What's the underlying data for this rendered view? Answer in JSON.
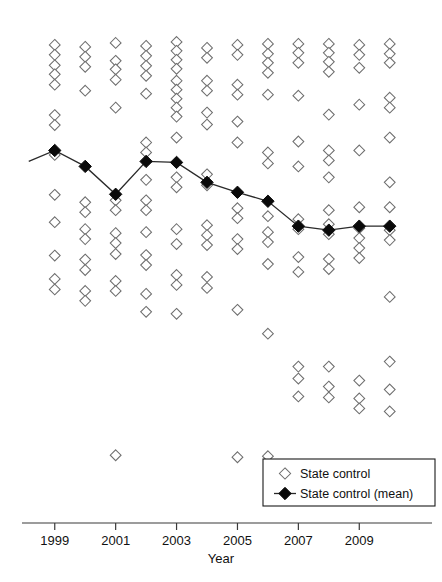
{
  "chart_data": {
    "type": "scatter",
    "title": "",
    "xlabel": "Year",
    "ylabel": "",
    "xlim": [
      1998.45,
      2010.6
    ],
    "ylim": [
      0,
      100
    ],
    "grid": false,
    "legend_position": "bottom-right",
    "x_tick_labels": [
      "1999",
      "2001",
      "2003",
      "2005",
      "2007",
      "2009"
    ],
    "x_tick_values": [
      1999,
      2001,
      2003,
      2005,
      2007,
      2009
    ],
    "x_all_categories": [
      1999,
      2000,
      2001,
      2002,
      2003,
      2004,
      2005,
      2006,
      2007,
      2008,
      2009,
      2010
    ],
    "y_axis_visible": false,
    "series": [
      {
        "name": "State control",
        "marker": "open-diamond",
        "marker_color": "#ffffff",
        "edge_color": "#6e6e6e",
        "points": [
          {
            "x": 1999,
            "y": 94.6
          },
          {
            "x": 1999,
            "y": 92.6
          },
          {
            "x": 1999,
            "y": 90.5
          },
          {
            "x": 1999,
            "y": 88.7
          },
          {
            "x": 1999,
            "y": 86.6
          },
          {
            "x": 1999,
            "y": 80.5
          },
          {
            "x": 1999,
            "y": 78.5
          },
          {
            "x": 1999,
            "y": 72.5
          },
          {
            "x": 1999,
            "y": 64.5
          },
          {
            "x": 1999,
            "y": 59.0
          },
          {
            "x": 1999,
            "y": 52.3
          },
          {
            "x": 1999,
            "y": 47.6
          },
          {
            "x": 1999,
            "y": 45.5
          },
          {
            "x": 2000,
            "y": 94.2
          },
          {
            "x": 2000,
            "y": 92.2
          },
          {
            "x": 2000,
            "y": 90.2
          },
          {
            "x": 2000,
            "y": 85.4
          },
          {
            "x": 2000,
            "y": 63.0
          },
          {
            "x": 2000,
            "y": 61.0
          },
          {
            "x": 2000,
            "y": 57.6
          },
          {
            "x": 2000,
            "y": 55.6
          },
          {
            "x": 2000,
            "y": 51.5
          },
          {
            "x": 2000,
            "y": 49.4
          },
          {
            "x": 2000,
            "y": 45.2
          },
          {
            "x": 2000,
            "y": 43.2
          },
          {
            "x": 2001,
            "y": 95.0
          },
          {
            "x": 2001,
            "y": 91.4
          },
          {
            "x": 2001,
            "y": 89.7
          },
          {
            "x": 2001,
            "y": 87.6
          },
          {
            "x": 2001,
            "y": 82.0
          },
          {
            "x": 2001,
            "y": 63.4
          },
          {
            "x": 2001,
            "y": 61.4
          },
          {
            "x": 2001,
            "y": 56.8
          },
          {
            "x": 2001,
            "y": 54.8
          },
          {
            "x": 2001,
            "y": 52.6
          },
          {
            "x": 2001,
            "y": 47.2
          },
          {
            "x": 2001,
            "y": 45.2
          },
          {
            "x": 2001,
            "y": 12.2
          },
          {
            "x": 2002,
            "y": 94.4
          },
          {
            "x": 2002,
            "y": 92.4
          },
          {
            "x": 2002,
            "y": 90.4
          },
          {
            "x": 2002,
            "y": 88.4
          },
          {
            "x": 2002,
            "y": 84.8
          },
          {
            "x": 2002,
            "y": 75.0
          },
          {
            "x": 2002,
            "y": 73.0
          },
          {
            "x": 2002,
            "y": 67.5
          },
          {
            "x": 2002,
            "y": 63.4
          },
          {
            "x": 2002,
            "y": 61.4
          },
          {
            "x": 2002,
            "y": 57.0
          },
          {
            "x": 2002,
            "y": 52.4
          },
          {
            "x": 2002,
            "y": 50.4
          },
          {
            "x": 2002,
            "y": 44.6
          },
          {
            "x": 2002,
            "y": 41.0
          },
          {
            "x": 2003,
            "y": 95.2
          },
          {
            "x": 2003,
            "y": 93.4
          },
          {
            "x": 2003,
            "y": 91.6
          },
          {
            "x": 2003,
            "y": 89.8
          },
          {
            "x": 2003,
            "y": 87.4
          },
          {
            "x": 2003,
            "y": 85.6
          },
          {
            "x": 2003,
            "y": 83.8
          },
          {
            "x": 2003,
            "y": 82.0
          },
          {
            "x": 2003,
            "y": 80.2
          },
          {
            "x": 2003,
            "y": 76.0
          },
          {
            "x": 2003,
            "y": 68.0
          },
          {
            "x": 2003,
            "y": 66.0
          },
          {
            "x": 2003,
            "y": 57.6
          },
          {
            "x": 2003,
            "y": 54.6
          },
          {
            "x": 2003,
            "y": 48.4
          },
          {
            "x": 2003,
            "y": 46.4
          },
          {
            "x": 2003,
            "y": 40.6
          },
          {
            "x": 2004,
            "y": 94.0
          },
          {
            "x": 2004,
            "y": 92.0
          },
          {
            "x": 2004,
            "y": 87.4
          },
          {
            "x": 2004,
            "y": 85.4
          },
          {
            "x": 2004,
            "y": 81.0
          },
          {
            "x": 2004,
            "y": 78.6
          },
          {
            "x": 2004,
            "y": 68.6
          },
          {
            "x": 2004,
            "y": 66.4
          },
          {
            "x": 2004,
            "y": 58.4
          },
          {
            "x": 2004,
            "y": 56.4
          },
          {
            "x": 2004,
            "y": 54.4
          },
          {
            "x": 2004,
            "y": 48.0
          },
          {
            "x": 2004,
            "y": 45.8
          },
          {
            "x": 2005,
            "y": 94.6
          },
          {
            "x": 2005,
            "y": 92.6
          },
          {
            "x": 2005,
            "y": 86.6
          },
          {
            "x": 2005,
            "y": 84.6
          },
          {
            "x": 2005,
            "y": 79.2
          },
          {
            "x": 2005,
            "y": 75.0
          },
          {
            "x": 2005,
            "y": 61.8
          },
          {
            "x": 2005,
            "y": 59.8
          },
          {
            "x": 2005,
            "y": 55.6
          },
          {
            "x": 2005,
            "y": 53.6
          },
          {
            "x": 2005,
            "y": 41.4
          },
          {
            "x": 2005,
            "y": 11.8
          },
          {
            "x": 2006,
            "y": 94.8
          },
          {
            "x": 2006,
            "y": 92.8
          },
          {
            "x": 2006,
            "y": 91.0
          },
          {
            "x": 2006,
            "y": 89.0
          },
          {
            "x": 2006,
            "y": 84.6
          },
          {
            "x": 2006,
            "y": 73.0
          },
          {
            "x": 2006,
            "y": 70.8
          },
          {
            "x": 2006,
            "y": 60.2
          },
          {
            "x": 2006,
            "y": 57.0
          },
          {
            "x": 2006,
            "y": 55.0
          },
          {
            "x": 2006,
            "y": 50.6
          },
          {
            "x": 2006,
            "y": 36.6
          },
          {
            "x": 2006,
            "y": 12.0
          },
          {
            "x": 2007,
            "y": 94.8
          },
          {
            "x": 2007,
            "y": 93.0
          },
          {
            "x": 2007,
            "y": 91.0
          },
          {
            "x": 2007,
            "y": 84.4
          },
          {
            "x": 2007,
            "y": 75.2
          },
          {
            "x": 2007,
            "y": 70.2
          },
          {
            "x": 2007,
            "y": 59.6
          },
          {
            "x": 2007,
            "y": 57.6
          },
          {
            "x": 2007,
            "y": 52.0
          },
          {
            "x": 2007,
            "y": 49.0
          },
          {
            "x": 2007,
            "y": 30.0
          },
          {
            "x": 2007,
            "y": 27.6
          },
          {
            "x": 2007,
            "y": 24.0
          },
          {
            "x": 2008,
            "y": 94.8
          },
          {
            "x": 2008,
            "y": 93.0
          },
          {
            "x": 2008,
            "y": 91.2
          },
          {
            "x": 2008,
            "y": 89.2
          },
          {
            "x": 2008,
            "y": 80.6
          },
          {
            "x": 2008,
            "y": 73.4
          },
          {
            "x": 2008,
            "y": 71.4
          },
          {
            "x": 2008,
            "y": 68.0
          },
          {
            "x": 2008,
            "y": 61.4
          },
          {
            "x": 2008,
            "y": 58.6
          },
          {
            "x": 2008,
            "y": 56.6
          },
          {
            "x": 2008,
            "y": 51.6
          },
          {
            "x": 2008,
            "y": 49.6
          },
          {
            "x": 2008,
            "y": 30.0
          },
          {
            "x": 2008,
            "y": 26.0
          },
          {
            "x": 2008,
            "y": 23.8
          },
          {
            "x": 2009,
            "y": 94.6
          },
          {
            "x": 2009,
            "y": 92.6
          },
          {
            "x": 2009,
            "y": 90.0
          },
          {
            "x": 2009,
            "y": 82.6
          },
          {
            "x": 2009,
            "y": 73.4
          },
          {
            "x": 2009,
            "y": 62.0
          },
          {
            "x": 2009,
            "y": 57.8
          },
          {
            "x": 2009,
            "y": 55.8
          },
          {
            "x": 2009,
            "y": 53.8
          },
          {
            "x": 2009,
            "y": 51.8
          },
          {
            "x": 2009,
            "y": 27.2
          },
          {
            "x": 2009,
            "y": 23.6
          },
          {
            "x": 2009,
            "y": 21.6
          },
          {
            "x": 2010,
            "y": 94.8
          },
          {
            "x": 2010,
            "y": 92.8
          },
          {
            "x": 2010,
            "y": 91.0
          },
          {
            "x": 2010,
            "y": 84.0
          },
          {
            "x": 2010,
            "y": 82.0
          },
          {
            "x": 2010,
            "y": 76.0
          },
          {
            "x": 2010,
            "y": 67.0
          },
          {
            "x": 2010,
            "y": 62.0
          },
          {
            "x": 2010,
            "y": 57.4
          },
          {
            "x": 2010,
            "y": 55.4
          },
          {
            "x": 2010,
            "y": 44.0
          },
          {
            "x": 2010,
            "y": 31.0
          },
          {
            "x": 2010,
            "y": 25.4
          },
          {
            "x": 2010,
            "y": 21.0
          }
        ]
      },
      {
        "name": "State control (mean)",
        "marker": "filled-diamond",
        "marker_color": "#0a0a0a",
        "line": true,
        "line_color": "#2a2a2a",
        "points": [
          {
            "x": 1999,
            "y": 73.4
          },
          {
            "x": 2000,
            "y": 70.2
          },
          {
            "x": 2001,
            "y": 64.6
          },
          {
            "x": 2002,
            "y": 71.2
          },
          {
            "x": 2003,
            "y": 71.0
          },
          {
            "x": 2004,
            "y": 67.0
          },
          {
            "x": 2005,
            "y": 65.0
          },
          {
            "x": 2006,
            "y": 63.2
          },
          {
            "x": 2007,
            "y": 58.2
          },
          {
            "x": 2008,
            "y": 57.4
          },
          {
            "x": 2009,
            "y": 58.2
          },
          {
            "x": 2010,
            "y": 58.2
          }
        ]
      }
    ]
  },
  "axis": {
    "x_title": "Year"
  },
  "legend": {
    "entries": [
      {
        "label": "State control",
        "marker": "open-diamond"
      },
      {
        "label": "State control (mean)",
        "marker": "filled-diamond-line"
      }
    ]
  }
}
